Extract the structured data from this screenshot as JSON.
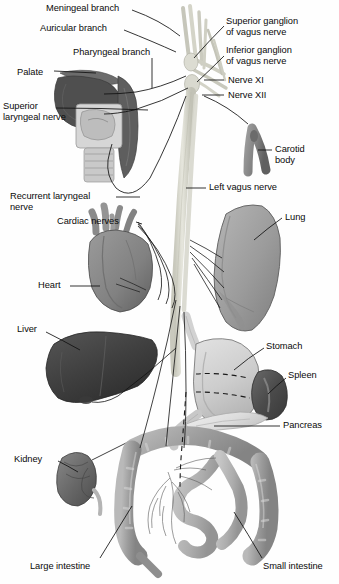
{
  "figure": {
    "type": "anatomical-illustration",
    "palette": {
      "background": "#fefefe",
      "line": "#111111",
      "nerve_trunk": "#d8d8cf",
      "nerve_trunk_edge": "#b4b4a8",
      "palate_dark": "#5a5a5a",
      "pharynx": "#6e6e6e",
      "larynx_light": "#d2d2d2",
      "trachea": "#c6c6c6",
      "carotid": "#8a8a8a",
      "heart": "#8c8c8c",
      "heart_shadow": "#6f6f6f",
      "lung": "#a0a0a0",
      "lung_shadow": "#8a8a8a",
      "liver": "#4a4a4a",
      "liver_shadow": "#3a3a3a",
      "stomach": "#cfcfcf",
      "stomach_edge": "#9a9a9a",
      "spleen": "#555555",
      "pancreas": "#e2e2e2",
      "kidney": "#6a6a6a",
      "large_intestine": "#9e9e9e",
      "small_intestine": "#b5b5b5"
    }
  },
  "labels": [
    {
      "id": "meningeal-branch",
      "text": "Meningeal branch",
      "x": 46,
      "y": 3,
      "align": "left"
    },
    {
      "id": "auricular-branch",
      "text": "Auricular branch",
      "x": 40,
      "y": 23,
      "align": "left"
    },
    {
      "id": "pharyngeal-branch",
      "text": "Pharyngeal branch",
      "x": 73,
      "y": 47,
      "align": "left"
    },
    {
      "id": "palate",
      "text": "Palate",
      "x": 17,
      "y": 67,
      "align": "left"
    },
    {
      "id": "superior-laryngeal-nerve",
      "text": "Superior\nlaryngeal nerve",
      "x": 3,
      "y": 104,
      "align": "left"
    },
    {
      "id": "superior-ganglion",
      "text": "Superior ganglion\nof vagus nerve",
      "x": 226,
      "y": 18,
      "align": "left"
    },
    {
      "id": "inferior-ganglion",
      "text": "Inferior ganglion\nof vagus nerve",
      "x": 226,
      "y": 47,
      "align": "left"
    },
    {
      "id": "nerve-xi",
      "text": "Nerve XI",
      "x": 226,
      "y": 75,
      "align": "left"
    },
    {
      "id": "nerve-xii",
      "text": "Nerve XII",
      "x": 226,
      "y": 90,
      "align": "left"
    },
    {
      "id": "carotid-body",
      "text": "Carotid\nbody",
      "x": 274,
      "y": 144,
      "align": "left"
    },
    {
      "id": "left-vagus-nerve",
      "text": "Left vagus nerve",
      "x": 208,
      "y": 183,
      "align": "left"
    },
    {
      "id": "recurrent-laryngeal-nerve",
      "text": "Recurrent laryngeal\nnerve",
      "x": 10,
      "y": 192,
      "align": "left"
    },
    {
      "id": "cardiac-nerves",
      "text": "Cardiac nerves",
      "x": 57,
      "y": 216,
      "align": "left"
    },
    {
      "id": "lung",
      "text": "Lung",
      "x": 284,
      "y": 212,
      "align": "left"
    },
    {
      "id": "heart",
      "text": "Heart",
      "x": 38,
      "y": 281,
      "align": "left"
    },
    {
      "id": "liver",
      "text": "Liver",
      "x": 17,
      "y": 325,
      "align": "left"
    },
    {
      "id": "stomach",
      "text": "Stomach",
      "x": 265,
      "y": 341,
      "align": "left"
    },
    {
      "id": "spleen",
      "text": "Spleen",
      "x": 288,
      "y": 370,
      "align": "left"
    },
    {
      "id": "pancreas",
      "text": "Pancreas",
      "x": 282,
      "y": 421,
      "align": "left"
    },
    {
      "id": "kidney",
      "text": "Kidney",
      "x": 14,
      "y": 455,
      "align": "left"
    },
    {
      "id": "large-intestine",
      "text": "Large intestine",
      "x": 30,
      "y": 562,
      "align": "left"
    },
    {
      "id": "small-intestine",
      "text": "Small intestine",
      "x": 264,
      "y": 562,
      "align": "left"
    }
  ],
  "structures": [
    {
      "id": "palate",
      "name": "Palate"
    },
    {
      "id": "pharynx",
      "name": "Pharynx"
    },
    {
      "id": "larynx",
      "name": "Larynx"
    },
    {
      "id": "trachea",
      "name": "Trachea"
    },
    {
      "id": "vagus-trunk",
      "name": "Vagus nerve trunk"
    },
    {
      "id": "cranial-nerve-roots",
      "name": "Cranial nerve roots"
    },
    {
      "id": "carotid-body",
      "name": "Carotid body"
    },
    {
      "id": "heart",
      "name": "Heart"
    },
    {
      "id": "lung",
      "name": "Lung"
    },
    {
      "id": "liver",
      "name": "Liver"
    },
    {
      "id": "stomach",
      "name": "Stomach"
    },
    {
      "id": "spleen",
      "name": "Spleen"
    },
    {
      "id": "pancreas",
      "name": "Pancreas"
    },
    {
      "id": "kidney",
      "name": "Kidney"
    },
    {
      "id": "large-intestine",
      "name": "Large intestine"
    },
    {
      "id": "small-intestine",
      "name": "Small intestine"
    }
  ]
}
